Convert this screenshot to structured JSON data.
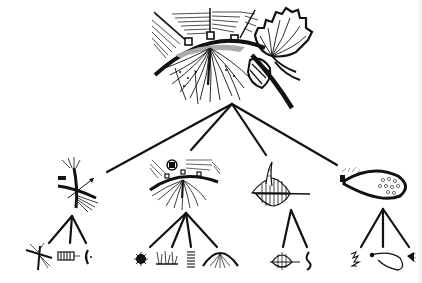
{
  "diagram": {
    "type": "tree",
    "background": "#ffffff",
    "ink_color": "#111111",
    "root": {
      "id": "root",
      "icon": "hemisphere-with-fan-and-branching-structure-icon",
      "children": [
        {
          "id": "branch-1",
          "icon": "crossing-fibers-with-arrow-icon",
          "children": [
            {
              "id": "leaf-1a",
              "icon": "star-burst-junction-icon"
            },
            {
              "id": "leaf-1b",
              "icon": "coiled-segment-icon"
            },
            {
              "id": "leaf-1c",
              "icon": "crescent-arc-icon"
            }
          ]
        },
        {
          "id": "branch-2",
          "icon": "hatched-dome-with-roots-icon",
          "children": [
            {
              "id": "leaf-2a",
              "icon": "dark-star-node-icon"
            },
            {
              "id": "leaf-2b",
              "icon": "tufted-row-icon"
            },
            {
              "id": "leaf-2c",
              "icon": "coil-spring-icon"
            },
            {
              "id": "leaf-2d",
              "icon": "hatched-dome-icon"
            }
          ]
        },
        {
          "id": "branch-3",
          "icon": "striped-spindle-with-spike-icon",
          "children": [
            {
              "id": "leaf-3a",
              "icon": "striped-spindle-icon"
            },
            {
              "id": "leaf-3b",
              "icon": "wavy-strand-icon"
            }
          ]
        },
        {
          "id": "branch-4",
          "icon": "dotted-teardrop-sac-icon",
          "children": [
            {
              "id": "leaf-4a",
              "icon": "scribble-cluster-icon"
            },
            {
              "id": "leaf-4b",
              "icon": "open-teardrop-loop-icon"
            },
            {
              "id": "leaf-4c",
              "icon": "small-fan-tuft-icon"
            }
          ]
        }
      ]
    },
    "labels": []
  }
}
